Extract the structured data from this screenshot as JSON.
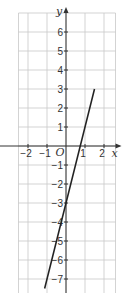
{
  "chart_data": {
    "type": "line",
    "title": "",
    "xlabel": "x",
    "ylabel": "y",
    "origin_label": "O",
    "xlim": [
      -2.5,
      2.5
    ],
    "ylim": [
      -7.5,
      7
    ],
    "grid": true,
    "x_ticks": [
      -2,
      -1,
      1,
      2
    ],
    "y_ticks": [
      6,
      5,
      4,
      3,
      2,
      1,
      -1,
      -2,
      -3,
      -4,
      -5,
      -6,
      -7
    ],
    "x_tick_labels": [
      "−2",
      "−1",
      "1",
      "2"
    ],
    "y_tick_labels": [
      "6",
      "5",
      "4",
      "3",
      "2",
      "1",
      "−1",
      "−2",
      "−3",
      "−4",
      "−5",
      "−6",
      "−7"
    ],
    "series": [
      {
        "name": "y = 4x − 3",
        "x": [
          -1.125,
          1.5
        ],
        "y": [
          -7.5,
          3
        ],
        "color": "#222222"
      }
    ],
    "colors": {
      "grid": "#c8c8c8",
      "axis": "#333333",
      "line": "#222222"
    }
  }
}
